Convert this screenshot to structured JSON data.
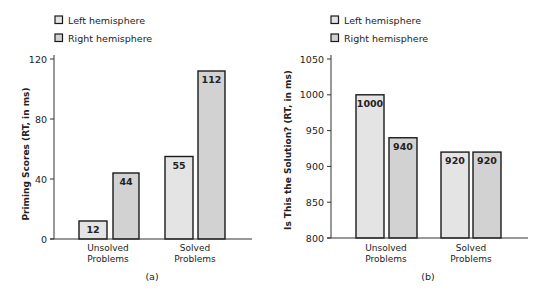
{
  "chart_data": [
    {
      "type": "bar",
      "panel_label": "(a)",
      "title": "",
      "xlabel": "",
      "ylabel": "Priming Scores (RT, in ms)",
      "categories": [
        "Unsolved Problems",
        "Solved Problems"
      ],
      "category_lines": [
        [
          "Unsolved",
          "Problems"
        ],
        [
          "Solved",
          "Problems"
        ]
      ],
      "series": [
        {
          "name": "Left hemisphere",
          "values": [
            12,
            55
          ],
          "color": "#e4e4e4"
        },
        {
          "name": "Right hemisphere",
          "values": [
            44,
            112
          ],
          "color": "#d2d2d2"
        }
      ],
      "ylim": [
        0,
        120
      ],
      "yticks": [
        0,
        40,
        80,
        120
      ],
      "grid": false,
      "legend_position": "top-left",
      "data_labels": true
    },
    {
      "type": "bar",
      "panel_label": "(b)",
      "title": "",
      "xlabel": "",
      "ylabel": "Is This the Solution? (RT, in ms)",
      "categories": [
        "Unsolved Problems",
        "Solved Problems"
      ],
      "category_lines": [
        [
          "Unsolved",
          "Problems"
        ],
        [
          "Solved",
          "Problems"
        ]
      ],
      "series": [
        {
          "name": "Left hemisphere",
          "values": [
            1000,
            920
          ],
          "color": "#e4e4e4"
        },
        {
          "name": "Right hemisphere",
          "values": [
            940,
            920
          ],
          "color": "#d2d2d2"
        }
      ],
      "ylim": [
        800,
        1050
      ],
      "yticks": [
        800,
        850,
        900,
        950,
        1000,
        1050
      ],
      "grid": false,
      "legend_position": "top-left",
      "data_labels": true
    }
  ],
  "colors": {
    "axis": "#333333",
    "bar_stroke": "#1a1a1a",
    "text": "#222222"
  }
}
